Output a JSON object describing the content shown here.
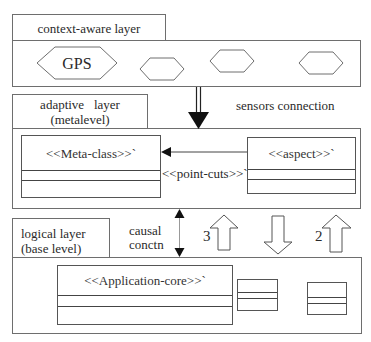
{
  "layers": {
    "context": {
      "tab_label": "context-aware layer",
      "sensors": [
        {
          "label": "GPS"
        },
        {
          "label": ""
        },
        {
          "label": ""
        },
        {
          "label": ""
        }
      ]
    },
    "adaptive": {
      "tab_line1": "adaptive   layer",
      "tab_line2": "(metalevel)",
      "meta_class": "<<Meta-class>>`",
      "aspect": "<<aspect>>`",
      "pointcuts": "<<point-cuts>>`"
    },
    "logical": {
      "tab_line1": "logical layer",
      "tab_line2": "(base level)",
      "app_core": "<<Application-core>>`"
    }
  },
  "connections": {
    "sensors_label": "sensors connection",
    "causal_line1": "causal",
    "causal_line2": "conctn",
    "arrow_up_left_label": "3",
    "arrow_up_right_label": "2"
  },
  "colors": {
    "stroke": "#6e6e6e",
    "text": "#2a2a2a",
    "arrow_fill": "#111111"
  }
}
